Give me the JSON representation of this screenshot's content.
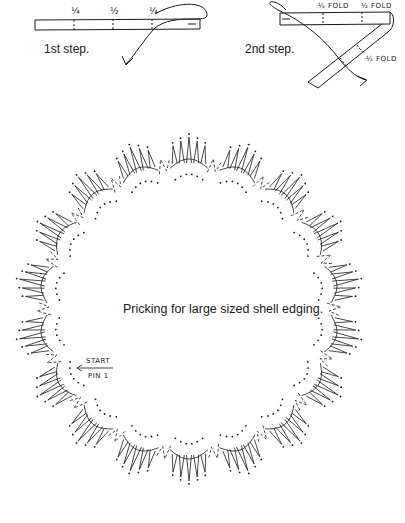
{
  "step1": {
    "label": "1st step.",
    "marks": [
      "¼",
      "½",
      "¼"
    ]
  },
  "step2": {
    "label": "2nd step.",
    "marks": [
      "¼ FOLD",
      "½ FOLD",
      "¼ FOLD"
    ]
  },
  "pricking": {
    "caption": "Pricking for large sized shell edging.",
    "start_label": "START",
    "pin_label": "PIN 1",
    "scallop_count": 18,
    "center": [
      189,
      309
    ],
    "outer_radius": 172,
    "inner_radius": 128
  },
  "colors": {
    "ink": "#1a1a1a",
    "background": "#ffffff"
  }
}
